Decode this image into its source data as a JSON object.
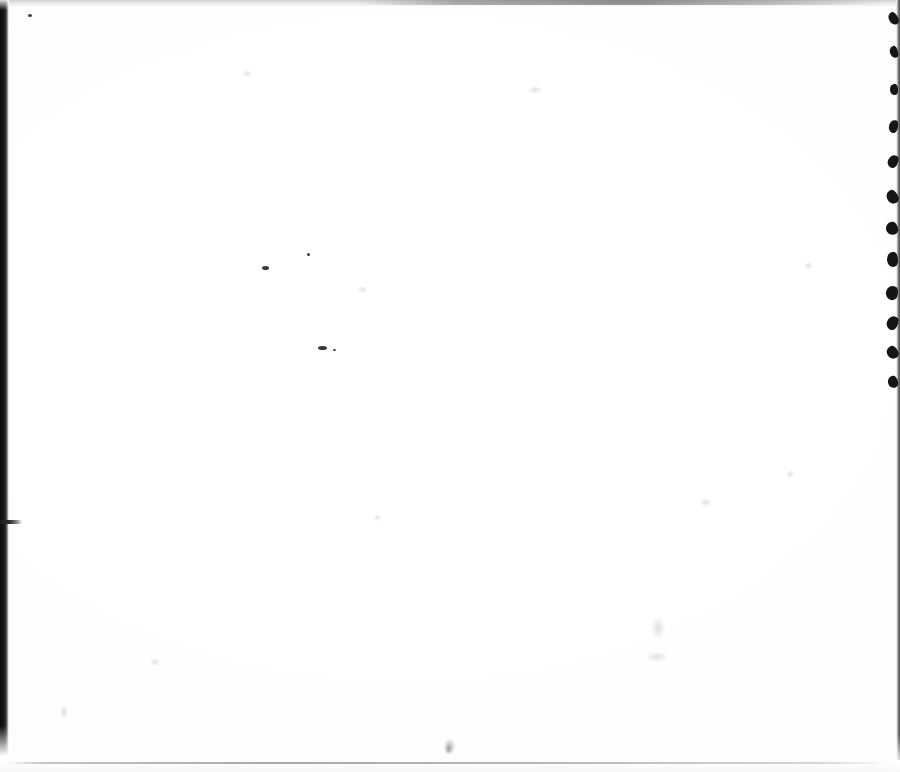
{
  "document": {
    "type": "scanned-page",
    "title": "Scanned blank page",
    "page_text": "",
    "visible_text": "",
    "width_px": 900,
    "height_px": 772,
    "background_color": "#ffffff",
    "paper_tone": "#fdfdfd",
    "note": "Blank scanned sheet; no printed or handwritten text is visible."
  },
  "artifacts": {
    "edge_colors": {
      "left_band": "#0d0d0d",
      "right_line": "#4a4a4a",
      "torn_blob": "#151515",
      "top_band": "#a8a8a8",
      "bottom_line": "#6e6e6e",
      "speck": "#3a3a3a"
    },
    "left_edge": {
      "label": "left scan edge band",
      "x": 0,
      "y": 0,
      "width": 9,
      "height": 756
    },
    "left_tick": {
      "label": "left edge tick mark",
      "x": 0,
      "y": 520,
      "width": 22,
      "height": 4
    },
    "right_edge": {
      "label": "right scan edge line",
      "x": 896,
      "y": 0,
      "width": 4,
      "height": 760
    },
    "top_band": {
      "label": "top gray scan band",
      "x": 0,
      "y": 0,
      "width": 900,
      "height": 7
    },
    "bottom_line": {
      "label": "bottom scan line",
      "x": 6,
      "y": 762,
      "width": 884,
      "height": 2
    },
    "torn_blobs": [
      {
        "top": 12,
        "w": 9,
        "h": 13
      },
      {
        "top": 46,
        "w": 8,
        "h": 12
      },
      {
        "top": 84,
        "w": 8,
        "h": 11
      },
      {
        "top": 120,
        "w": 9,
        "h": 13
      },
      {
        "top": 155,
        "w": 10,
        "h": 13
      },
      {
        "top": 190,
        "w": 11,
        "h": 14
      },
      {
        "top": 222,
        "w": 12,
        "h": 13
      },
      {
        "top": 252,
        "w": 11,
        "h": 15
      },
      {
        "top": 286,
        "w": 12,
        "h": 14
      },
      {
        "top": 316,
        "w": 11,
        "h": 14
      },
      {
        "top": 346,
        "w": 11,
        "h": 13
      },
      {
        "top": 376,
        "w": 10,
        "h": 12
      }
    ],
    "specks": [
      {
        "x": 28,
        "y": 14,
        "w": 4,
        "h": 3
      },
      {
        "x": 262,
        "y": 266,
        "w": 7,
        "h": 4
      },
      {
        "x": 307,
        "y": 253,
        "w": 3,
        "h": 3
      },
      {
        "x": 318,
        "y": 346,
        "w": 9,
        "h": 4
      },
      {
        "x": 333,
        "y": 349,
        "w": 3,
        "h": 2
      }
    ],
    "smudges": [
      {
        "x": 444,
        "y": 739,
        "w": 11,
        "h": 15
      },
      {
        "x": 445,
        "y": 745,
        "w": 7,
        "h": 9
      }
    ],
    "faint_marks": [
      {
        "x": 358,
        "y": 286,
        "w": 9,
        "h": 7
      },
      {
        "x": 374,
        "y": 514,
        "w": 7,
        "h": 7
      },
      {
        "x": 651,
        "y": 617,
        "w": 14,
        "h": 22
      },
      {
        "x": 646,
        "y": 652,
        "w": 22,
        "h": 10
      },
      {
        "x": 804,
        "y": 262,
        "w": 9,
        "h": 8
      },
      {
        "x": 786,
        "y": 470,
        "w": 8,
        "h": 8
      },
      {
        "x": 150,
        "y": 658,
        "w": 10,
        "h": 8
      },
      {
        "x": 60,
        "y": 706,
        "w": 8,
        "h": 12
      },
      {
        "x": 700,
        "y": 498,
        "w": 12,
        "h": 9
      },
      {
        "x": 528,
        "y": 86,
        "w": 14,
        "h": 8
      },
      {
        "x": 242,
        "y": 70,
        "w": 10,
        "h": 7
      }
    ]
  }
}
